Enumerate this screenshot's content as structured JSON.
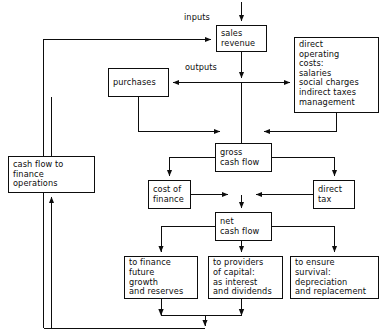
{
  "diagram": {
    "type": "flowchart",
    "background_color": "#ffffff",
    "line_color": "#0d0d0d",
    "text_color": "#0d0d0d",
    "top_partial_text": "",
    "nodes": [
      {
        "id": "sales_revenue",
        "label": "sales\nrevenue",
        "x": 216,
        "y": 25,
        "w": 51,
        "h": 27
      },
      {
        "id": "direct_operating_costs",
        "label": "direct\noperating\ncosts:\nsalaries\nsocial charges\nindirect taxes\nmanagement",
        "x": 294,
        "y": 37,
        "w": 85,
        "h": 76
      },
      {
        "id": "purchases",
        "label": "purchases",
        "x": 108,
        "y": 68,
        "w": 61,
        "h": 29
      },
      {
        "id": "cash_flow_to_finance_operations",
        "label": "cash flow to\nfinance\noperations",
        "x": 8,
        "y": 156,
        "w": 87,
        "h": 37
      },
      {
        "id": "gross_cash_flow",
        "label": "gross\ncash flow",
        "x": 215,
        "y": 143,
        "w": 57,
        "h": 29
      },
      {
        "id": "cost_of_finance",
        "label": "cost of\nfinance",
        "x": 148,
        "y": 180,
        "w": 43,
        "h": 29
      },
      {
        "id": "direct_tax",
        "label": "direct\ntax",
        "x": 313,
        "y": 180,
        "w": 42,
        "h": 29
      },
      {
        "id": "net_cash_flow",
        "label": "net\ncash flow",
        "x": 215,
        "y": 212,
        "w": 57,
        "h": 29
      },
      {
        "id": "to_finance_future_growth",
        "label": "to finance\nfuture\ngrowth\nand reserves",
        "x": 124,
        "y": 256,
        "w": 74,
        "h": 43
      },
      {
        "id": "to_providers_of_capital",
        "label": "to providers\nof capital:\nas interest\nand dividends",
        "x": 208,
        "y": 256,
        "w": 75,
        "h": 43
      },
      {
        "id": "to_ensure_survival",
        "label": "to ensure\nsurvival:\ndepreciation\nand replacement",
        "x": 290,
        "y": 256,
        "w": 89,
        "h": 43
      }
    ],
    "edge_labels": [
      {
        "id": "inputs",
        "label": "inputs",
        "x": 183,
        "y": 13
      },
      {
        "id": "outputs",
        "label": "outputs",
        "x": 184,
        "y": 63
      }
    ],
    "edges": [
      {
        "from": "external-top",
        "to": "sales_revenue",
        "kind": "arrow-down"
      },
      {
        "from": "feedback-left",
        "to": "sales_revenue",
        "kind": "arrow-right",
        "label": "inputs"
      },
      {
        "from": "sales_revenue",
        "to": "direct_operating_costs",
        "kind": "arrow-right",
        "label": "outputs"
      },
      {
        "from": "sales_revenue",
        "to": "purchases",
        "kind": "arrow-left",
        "label": "outputs"
      },
      {
        "from": "purchases",
        "to": "gross_cash_flow",
        "kind": "arrow-right"
      },
      {
        "from": "direct_operating_costs",
        "to": "gross_cash_flow",
        "kind": "arrow-left"
      },
      {
        "from": "gross_cash_flow",
        "to": "cost_of_finance",
        "kind": "arrow-down"
      },
      {
        "from": "gross_cash_flow",
        "to": "direct_tax",
        "kind": "arrow-down"
      },
      {
        "from": "cost_of_finance",
        "to": "net_cash_flow",
        "kind": "arrow-right"
      },
      {
        "from": "direct_tax",
        "to": "net_cash_flow",
        "kind": "arrow-left"
      },
      {
        "from": "net_cash_flow",
        "to": "to_finance_future_growth",
        "kind": "arrow-down"
      },
      {
        "from": "net_cash_flow",
        "to": "to_providers_of_capital",
        "kind": "arrow-down"
      },
      {
        "from": "net_cash_flow",
        "to": "to_ensure_survival",
        "kind": "arrow-down"
      },
      {
        "from": "to_finance_future_growth",
        "to": "feedback-bottom",
        "kind": "arrow-down"
      },
      {
        "from": "to_providers_of_capital",
        "to": "feedback-bottom",
        "kind": "arrow-down"
      },
      {
        "from": "feedback-bottom",
        "to": "cash_flow_to_finance_operations",
        "kind": "arrow-up"
      },
      {
        "from": "cash_flow_to_finance_operations",
        "to": "feedback-left",
        "kind": "line-up"
      }
    ]
  }
}
